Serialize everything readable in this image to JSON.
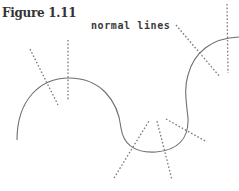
{
  "figure": {
    "title": "Figure 1.11",
    "label": "normal lines"
  },
  "colors": {
    "curve": "#6e6e6e",
    "normal_lines": "#7a7a7a",
    "text": "#333333"
  },
  "diagram": {
    "curve_path": "M17,140 C17,100 40,78 69,78 C100,78 118,100 121,128 C124,148 138,153 156,152 C178,150 189,138 188,118 C186,100 184,88 188,75 C194,52 212,38 239,37",
    "normal_lines": [
      {
        "name": "normal-line-1",
        "x1": 68,
        "y1": 40,
        "x2": 68,
        "y2": 100
      },
      {
        "name": "normal-line-2",
        "x1": 30,
        "y1": 49,
        "x2": 58,
        "y2": 105
      },
      {
        "name": "normal-line-3",
        "x1": 114,
        "y1": 178,
        "x2": 149,
        "y2": 121
      },
      {
        "name": "normal-line-4",
        "x1": 157,
        "y1": 121,
        "x2": 172,
        "y2": 180
      },
      {
        "name": "normal-line-5",
        "x1": 166,
        "y1": 119,
        "x2": 207,
        "y2": 142
      },
      {
        "name": "normal-line-6",
        "x1": 176,
        "y1": 25,
        "x2": 220,
        "y2": 77
      },
      {
        "name": "normal-line-7",
        "x1": 227,
        "y1": 4,
        "x2": 228,
        "y2": 73
      }
    ]
  }
}
